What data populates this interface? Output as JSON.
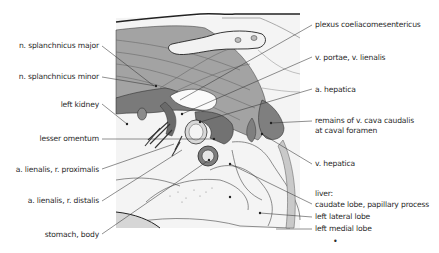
{
  "figure": {
    "type": "anatomical-illustration",
    "colors": {
      "muscle_gray": "#9a9a9a",
      "dark_gray": "#6f6f6f",
      "light_gray": "#cfcfcf",
      "outline": "#2a2a2a",
      "background": "#ffffff"
    }
  },
  "labels_left": [
    {
      "id": "n-splanchnicus-major",
      "text": "n. splanchnicus major"
    },
    {
      "id": "n-splanchnicus-minor",
      "text": "n. splanchnicus minor"
    },
    {
      "id": "left-kidney",
      "text": "left kidney"
    },
    {
      "id": "lesser-omentum",
      "text": "lesser omentum"
    },
    {
      "id": "a-lienalis-r-proximalis",
      "text": "a. lienalis, r. proximalis"
    },
    {
      "id": "a-lienalis-r-distalis",
      "text": "a. lienalis, r. distalis"
    },
    {
      "id": "stomach-body",
      "text": "stomach, body"
    }
  ],
  "labels_right": [
    {
      "id": "plexus-coeliacomesentericus",
      "text": "plexus coeliacomesentericus"
    },
    {
      "id": "v-portae-v-lienalis",
      "text": "v. portae, v. lienalis"
    },
    {
      "id": "a-hepatica",
      "text": "a. hepatica"
    },
    {
      "id": "remains-v-cava-caudalis",
      "text": "remains of v. cava caudalis",
      "text2": "at caval foramen"
    },
    {
      "id": "v-hepatica",
      "text": "v. hepatica"
    },
    {
      "id": "liver-header",
      "text": "liver:"
    },
    {
      "id": "caudate-lobe",
      "text": "caudate lobe, papillary process"
    },
    {
      "id": "left-lateral-lobe",
      "text": "left lateral lobe"
    },
    {
      "id": "left-medial-lobe",
      "text": "left medial lobe"
    }
  ],
  "footer_mark": "•"
}
